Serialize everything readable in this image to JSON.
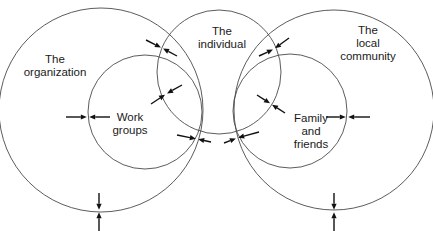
{
  "diagram": {
    "stroke_color": "#4a4a4a",
    "arrow_color": "#111111",
    "background": "#ffffff",
    "circles": [
      {
        "id": "organization",
        "cx": 101,
        "cy": 110,
        "r": 102
      },
      {
        "id": "work-groups",
        "cx": 145,
        "cy": 112,
        "r": 57
      },
      {
        "id": "individual",
        "cx": 219,
        "cy": 72,
        "r": 62
      },
      {
        "id": "family",
        "cx": 290,
        "cy": 111,
        "r": 57
      },
      {
        "id": "community",
        "cx": 334,
        "cy": 110,
        "r": 100
      }
    ],
    "labels": {
      "organization": [
        "The",
        "organization"
      ],
      "work_groups": [
        "Work",
        "groups"
      ],
      "individual": [
        "The",
        "individual"
      ],
      "community": [
        "The",
        "local",
        "community"
      ],
      "family": [
        "Family",
        "and",
        "friends"
      ]
    },
    "arrow_pairs": [
      {
        "name": "work-groups-organization-left",
        "contact": [
          88,
          117
        ],
        "from_a": [
          66,
          117
        ],
        "from_b": [
          110,
          117
        ]
      },
      {
        "name": "organization-individual-upper",
        "contact": [
          162,
          48
        ],
        "from_a": [
          146,
          40
        ],
        "from_b": [
          177,
          56
        ]
      },
      {
        "name": "work-groups-individual",
        "contact": [
          166,
          94
        ],
        "from_a": [
          151,
          104
        ],
        "from_b": [
          182,
          85
        ]
      },
      {
        "name": "organization-individual-lower",
        "contact": [
          197,
          139
        ],
        "from_a": [
          177,
          135
        ],
        "from_b": [
          211,
          142
        ]
      },
      {
        "name": "community-individual-lower",
        "contact": [
          237,
          138
        ],
        "from_a": [
          224,
          143
        ],
        "from_b": [
          259,
          132
        ]
      },
      {
        "name": "family-individual",
        "contact": [
          271,
          104
        ],
        "from_a": [
          257,
          95
        ],
        "from_b": [
          285,
          113
        ]
      },
      {
        "name": "community-individual-upper",
        "contact": [
          274,
          49
        ],
        "from_a": [
          259,
          56
        ],
        "from_b": [
          289,
          38
        ]
      },
      {
        "name": "family-community-right",
        "contact": [
          347,
          117
        ],
        "from_a": [
          326,
          117
        ],
        "from_b": [
          370,
          117
        ]
      },
      {
        "name": "organization-bottom",
        "contact": [
          99,
          211
        ],
        "from_a": [
          99,
          193
        ],
        "from_b": [
          99,
          231
        ]
      },
      {
        "name": "community-bottom",
        "contact": [
          334,
          211
        ],
        "from_a": [
          334,
          193
        ],
        "from_b": [
          334,
          231
        ]
      }
    ]
  }
}
